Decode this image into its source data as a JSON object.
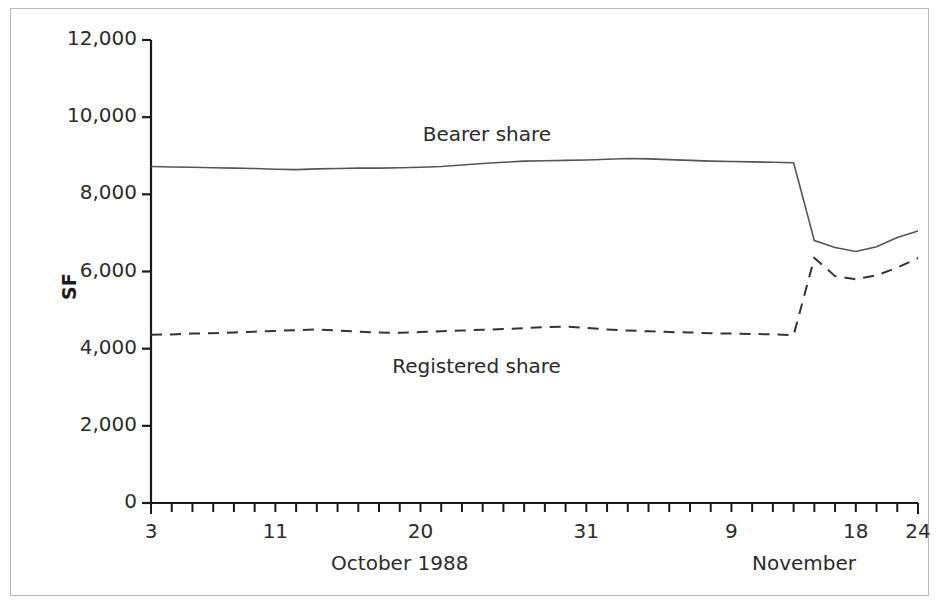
{
  "chart_data": {
    "type": "line",
    "title": "",
    "xlabel": "October 1988 / November",
    "ylabel": "SF",
    "ylim": [
      0,
      12000
    ],
    "ytick_labels": [
      "0",
      "2,000",
      "4,000",
      "6,000",
      "8,000",
      "10,000",
      "12,000"
    ],
    "ytick_values": [
      0,
      2000,
      4000,
      6000,
      8000,
      10000,
      12000
    ],
    "grid": false,
    "legend_position": "inline-annotation",
    "x_axis": {
      "tick_count": 38,
      "labeled_ticks": [
        {
          "index": 0,
          "label": "3"
        },
        {
          "index": 6,
          "label": "11"
        },
        {
          "index": 13,
          "label": "20"
        },
        {
          "index": 21,
          "label": "31"
        },
        {
          "index": 28,
          "label": "9"
        },
        {
          "index": 34,
          "label": "18"
        },
        {
          "index": 37,
          "label": "24"
        }
      ],
      "period_labels": [
        {
          "text": "October 1988",
          "index": 12.0
        },
        {
          "text": "November",
          "index": 31.5
        }
      ]
    },
    "series": [
      {
        "name": "Bearer share",
        "style": "solid",
        "color": "#555555",
        "label_annotation": {
          "text": "Bearer share",
          "index": 15.0,
          "value": 9500
        },
        "x": [
          0,
          1,
          2,
          3,
          4,
          5,
          6,
          7,
          8,
          9,
          10,
          11,
          12,
          13,
          14,
          15,
          16,
          17,
          18,
          19,
          20,
          21,
          22,
          23,
          24,
          25,
          26,
          27,
          28,
          29,
          30,
          31,
          32,
          33,
          34,
          35,
          36,
          37
        ],
        "values": [
          8720,
          8710,
          8700,
          8690,
          8680,
          8670,
          8650,
          8640,
          8660,
          8670,
          8680,
          8680,
          8690,
          8700,
          8720,
          8760,
          8800,
          8830,
          8860,
          8870,
          8880,
          8890,
          8910,
          8930,
          8920,
          8900,
          8880,
          8860,
          8850,
          8840,
          8830,
          8820,
          6800,
          6620,
          6520,
          6640,
          6880,
          7050
        ]
      },
      {
        "name": "Registered share",
        "style": "dashed",
        "color": "#333333",
        "label_annotation": {
          "text": "Registered share",
          "index": 14.5,
          "value": 3500
        },
        "x": [
          0,
          1,
          2,
          3,
          4,
          5,
          6,
          7,
          8,
          9,
          10,
          11,
          12,
          13,
          14,
          15,
          16,
          17,
          18,
          19,
          20,
          21,
          22,
          23,
          24,
          25,
          26,
          27,
          28,
          29,
          30,
          31,
          32,
          33,
          34,
          35,
          36,
          37
        ],
        "values": [
          4360,
          4370,
          4390,
          4400,
          4420,
          4440,
          4460,
          4480,
          4500,
          4470,
          4440,
          4420,
          4410,
          4430,
          4450,
          4470,
          4490,
          4510,
          4530,
          4560,
          4570,
          4540,
          4500,
          4470,
          4450,
          4430,
          4420,
          4400,
          4390,
          4380,
          4370,
          4350,
          6350,
          5880,
          5800,
          5900,
          6100,
          6350
        ]
      }
    ]
  },
  "axes": {
    "y_title": "SF",
    "x_period_october": "October 1988",
    "x_period_november": "November"
  },
  "annotations": {
    "bearer": "Bearer share",
    "registered": "Registered share"
  },
  "colors": {
    "frame": "#b9b9b9",
    "axis": "#1a1a1a",
    "bearer_line": "#555555",
    "registered_line": "#333333",
    "text": "#2b2b2b"
  }
}
